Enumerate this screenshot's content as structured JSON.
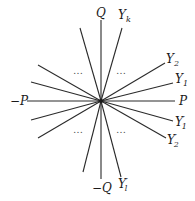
{
  "diagram": {
    "type": "star-of-rays",
    "center": {
      "x": 101,
      "y": 101
    },
    "rays": [
      {
        "name": "Q",
        "end": [
          101,
          20
        ]
      },
      {
        "name": "Yk",
        "end": [
          122,
          28
        ]
      },
      {
        "name": "Y2",
        "end": [
          165,
          63
        ]
      },
      {
        "name": "Y1",
        "end": [
          173,
          83
        ]
      },
      {
        "name": "P",
        "end": [
          175,
          101
        ]
      },
      {
        "name": "Y1p",
        "end": [
          173,
          121
        ]
      },
      {
        "name": "Y2p",
        "end": [
          166,
          138
        ]
      },
      {
        "name": "Ylp",
        "end": [
          121,
          177
        ]
      },
      {
        "name": "negQ",
        "end": [
          101,
          179
        ]
      },
      {
        "name": "unlabeled-lower-left-steep",
        "end": [
          83,
          172
        ]
      },
      {
        "name": "unlabeled-lower-left-mid",
        "end": [
          38,
          138
        ]
      },
      {
        "name": "unlabeled-lower-left-shallow",
        "end": [
          31,
          120
        ]
      },
      {
        "name": "negP",
        "end": [
          27,
          101
        ]
      },
      {
        "name": "unlabeled-upper-left-shallow",
        "end": [
          31,
          82
        ]
      },
      {
        "name": "unlabeled-upper-left-mid",
        "end": [
          38,
          65
        ]
      },
      {
        "name": "unlabeled-upper-left-steep",
        "end": [
          80,
          28
        ]
      }
    ],
    "labels": {
      "Q": {
        "main": "Q",
        "sub": "",
        "prime": ""
      },
      "Yk": {
        "main": "Y",
        "sub": "k",
        "prime": ""
      },
      "Y2": {
        "main": "Y",
        "sub": "2",
        "prime": ""
      },
      "Y1": {
        "main": "Y",
        "sub": "1",
        "prime": ""
      },
      "P": {
        "main": "P",
        "sub": "",
        "prime": ""
      },
      "negP": {
        "main": "−P",
        "sub": "",
        "prime": ""
      },
      "Y1p": {
        "main": "Y",
        "sub": "1",
        "prime": "′"
      },
      "Y2p": {
        "main": "Y",
        "sub": "2",
        "prime": "′"
      },
      "negQ": {
        "main": "−Q",
        "sub": "",
        "prime": ""
      },
      "Ylp": {
        "main": "Y",
        "sub": "l",
        "prime": "′"
      }
    },
    "ellipses": {
      "upper_left": "…",
      "upper_right": "…",
      "lower_left": "…",
      "lower_right": "…"
    }
  }
}
